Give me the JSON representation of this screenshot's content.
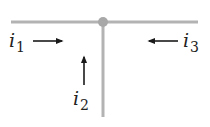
{
  "diagram": {
    "colors": {
      "wire": "#b3b3b3",
      "junction": "#a8a8a8",
      "arrow": "#1a1a1a",
      "text": "#222222"
    },
    "wires": [
      {
        "id": "horizontal",
        "x1": 11,
        "y1": 22,
        "x2": 198,
        "y2": 22
      },
      {
        "id": "vertical",
        "x1": 103,
        "y1": 22,
        "x2": 103,
        "y2": 117
      }
    ],
    "junction": {
      "x": 103,
      "y": 22,
      "r": 5
    },
    "currents": [
      {
        "symbol": "i",
        "subscript": "1",
        "direction": "right",
        "label_x": 9,
        "label_y": 33
      },
      {
        "symbol": "i",
        "subscript": "2",
        "direction": "up",
        "label_x": 74,
        "label_y": 91
      },
      {
        "symbol": "i",
        "subscript": "3",
        "direction": "left",
        "label_x": 183,
        "label_y": 33
      }
    ]
  }
}
